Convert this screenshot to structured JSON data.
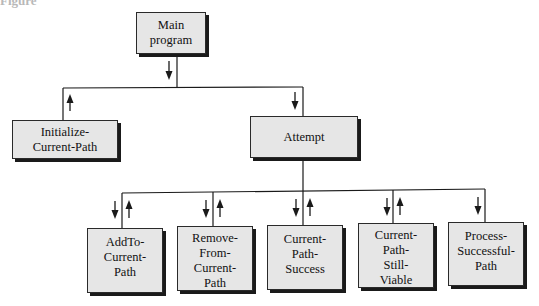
{
  "figure": {
    "caption": "Figure"
  },
  "nodes": {
    "main": {
      "label": "Main\nprogram"
    },
    "initialize": {
      "label": "Initialize-\nCurrent-Path"
    },
    "attempt": {
      "label": "Attempt"
    },
    "add_to": {
      "label": "AddTo-\nCurrent-\nPath"
    },
    "remove_from": {
      "label": "Remove-\nFrom-\nCurrent-\nPath"
    },
    "success": {
      "label": "Current-\nPath-\nSuccess"
    },
    "still_viable": {
      "label": "Current-\nPath-\nStill-\nViable"
    },
    "process": {
      "label": "Process-\nSuccessful-\nPath"
    }
  },
  "edges": [
    {
      "from": "Main program",
      "to": "Initialize-Current-Path",
      "arrows": [
        "up"
      ]
    },
    {
      "from": "Main program",
      "to": "Attempt",
      "arrows": [
        "down"
      ]
    },
    {
      "from": "Attempt",
      "to": "AddTo-Current-Path",
      "arrows": [
        "down",
        "up"
      ]
    },
    {
      "from": "Attempt",
      "to": "Remove-From-Current-Path",
      "arrows": [
        "down",
        "up"
      ]
    },
    {
      "from": "Attempt",
      "to": "Current-Path-Success",
      "arrows": [
        "down",
        "up"
      ]
    },
    {
      "from": "Attempt",
      "to": "Current-Path-Still-Viable",
      "arrows": [
        "down",
        "up"
      ]
    },
    {
      "from": "Attempt",
      "to": "Process-Successful-Path",
      "arrows": [
        "down"
      ]
    }
  ],
  "colors": {
    "box_fill": "#e6e6e6",
    "line": "#1a1a1a",
    "shadow": "#1a1a1a"
  }
}
